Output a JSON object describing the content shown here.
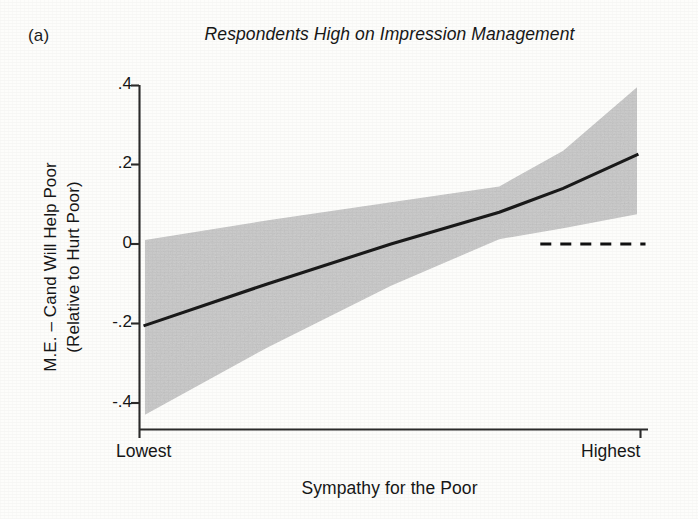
{
  "panel": {
    "label": "(a)"
  },
  "chart_data": {
    "type": "line",
    "title": "Respondents High on Impression Management",
    "xlabel": "Sympathy for the Poor",
    "ylabel_line1": "M.E. – Cand Will Help Poor",
    "ylabel_line2": "(Relative to Hurt Poor)",
    "grid": false,
    "legend": "none",
    "xlim": [
      0,
      1
    ],
    "ylim": [
      -0.4,
      0.4
    ],
    "x_tick_labels": [
      "Lowest",
      "Highest"
    ],
    "x_tick_values": [
      0,
      1
    ],
    "y_tick_labels": [
      ".4",
      ".2",
      "0",
      "-.2",
      "-.4"
    ],
    "y_tick_values": [
      0.4,
      0.2,
      0,
      -0.2,
      -0.4
    ],
    "series": [
      {
        "name": "Marginal effect (fit)",
        "type": "line",
        "color": "#1a1a1a",
        "x": [
          0,
          0.25,
          0.5,
          0.72,
          0.85,
          1
        ],
        "values": [
          -0.205,
          -0.1,
          0.0,
          0.08,
          0.14,
          0.225
        ]
      },
      {
        "name": "95% confidence interval (upper)",
        "type": "band-edge",
        "x": [
          0,
          0.25,
          0.5,
          0.72,
          0.85,
          1
        ],
        "values": [
          0.01,
          0.06,
          0.105,
          0.145,
          0.235,
          0.395
        ]
      },
      {
        "name": "95% confidence interval (lower)",
        "type": "band-edge",
        "x": [
          0,
          0.25,
          0.5,
          0.72,
          0.85,
          1
        ],
        "values": [
          -0.43,
          -0.26,
          -0.105,
          0.012,
          0.04,
          0.075
        ]
      },
      {
        "name": "Zero reference line",
        "type": "dashed-hline",
        "color": "#111111",
        "y": 0,
        "x_start": 0.8,
        "x_end": 1.01
      }
    ],
    "band_color": "#c9c9c9",
    "annotations": []
  }
}
